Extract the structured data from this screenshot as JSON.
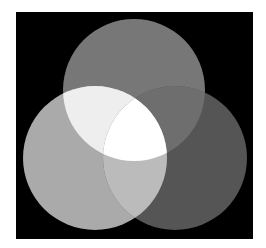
{
  "diagram": {
    "type": "venn",
    "sets": 3,
    "background_color": "#ffffff",
    "panel_color": "#000000",
    "circles": [
      {
        "id": "top",
        "cx": 134,
        "cy": 90,
        "r": 71,
        "color": "#777777"
      },
      {
        "id": "left",
        "cx": 95,
        "cy": 158,
        "r": 72,
        "color": "#aaaaaa"
      },
      {
        "id": "right",
        "cx": 175,
        "cy": 158,
        "r": 72,
        "color": "#555555"
      }
    ],
    "regions": {
      "top_only": "#777777",
      "left_only": "#aaaaaa",
      "right_only": "#555555",
      "top_left": "#eeeeee",
      "top_right": "#6e6e6e",
      "left_right": "#bbbbbb",
      "all_three": "#ffffff"
    }
  }
}
